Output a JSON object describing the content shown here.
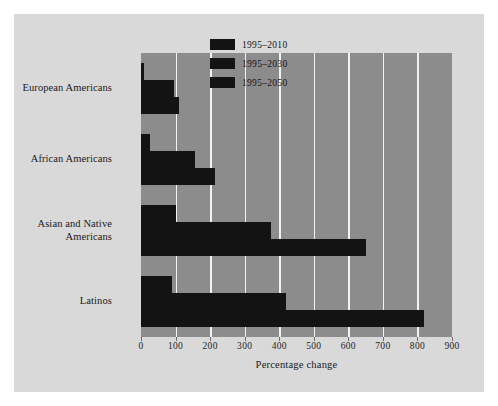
{
  "figure": {
    "background_color": "#d9d9d9",
    "plot_background_color": "#8c8c8c",
    "gridline_color": "#f2f2f2",
    "bar_color": "#131313",
    "page_background_color": "#ffffff"
  },
  "chart_data": {
    "type": "bar",
    "orientation": "horizontal",
    "title": "",
    "subtitle": "",
    "xlabel": "Percentage change",
    "ylabel": "",
    "xlim": [
      0,
      900
    ],
    "xticks": [
      0,
      100,
      200,
      300,
      400,
      500,
      600,
      700,
      800,
      900
    ],
    "xtick_labels": [
      "0",
      "100",
      "200",
      "300",
      "400",
      "500",
      "600",
      "700",
      "800",
      "900"
    ],
    "grid": "vertical",
    "legend_position": "upper right",
    "categories": [
      "European Americans",
      "African Americans",
      "Asian and Native Americans",
      "Latinos"
    ],
    "series": [
      {
        "name": "1995–2010",
        "values": [
          8,
          25,
          100,
          90
        ]
      },
      {
        "name": "1995–2030",
        "values": [
          95,
          155,
          375,
          420
        ]
      },
      {
        "name": "1995–2050",
        "values": [
          110,
          215,
          650,
          820
        ]
      }
    ]
  },
  "legend": {
    "entries": [
      {
        "label": "1995–2010",
        "swatch_color": "#131313"
      },
      {
        "label": "1995–2030",
        "swatch_color": "#131313"
      },
      {
        "label": "1995–2050",
        "swatch_color": "#131313"
      }
    ]
  },
  "category_labels": [
    {
      "line1": "European Americans",
      "line2": ""
    },
    {
      "line1": "African Americans",
      "line2": ""
    },
    {
      "line1": "Asian and Native",
      "line2": "Americans"
    },
    {
      "line1": "Latinos",
      "line2": ""
    }
  ]
}
